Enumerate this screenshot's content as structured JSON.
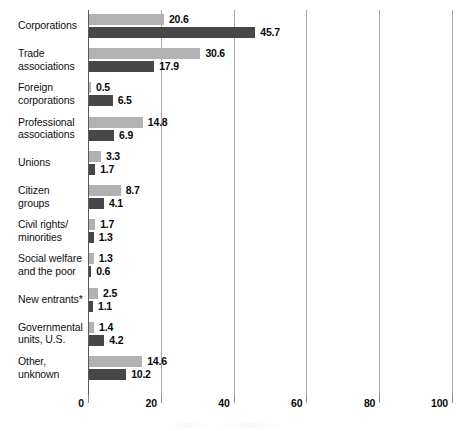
{
  "chart_data": {
    "type": "bar",
    "orientation": "horizontal",
    "title": "",
    "subtitle": "",
    "xlabel": "",
    "ylabel": "",
    "xlim": [
      0,
      100
    ],
    "xticks": [
      0,
      20,
      40,
      60,
      80,
      100
    ],
    "xtick_labels": [
      "0",
      "20",
      "40",
      "60",
      "80",
      "100"
    ],
    "grid": "vertical",
    "legend": "none",
    "footnote_marker": "*",
    "categories": [
      "Corporations",
      "Trade\nassociations",
      "Foreign\ncorporations",
      "Professional\nassociations",
      "Unions",
      "Citizen\ngroups",
      "Civil rights/\nminorities",
      "Social welfare\nand the poor",
      "New entrants*",
      "Governmental\nunits, U.S.",
      "Other,\nunknown"
    ],
    "series": [
      {
        "name": "series-light",
        "color": "#b2b2b2",
        "values": [
          20.6,
          30.6,
          0.5,
          14.8,
          3.3,
          8.7,
          1.7,
          1.3,
          2.5,
          1.4,
          14.6
        ],
        "value_labels": [
          "20.6",
          "30.6",
          "0.5",
          "14.8",
          "3.3",
          "8.7",
          "1.7",
          "1.3",
          "2.5",
          "1.4",
          "14.6"
        ]
      },
      {
        "name": "series-dark",
        "color": "#474747",
        "values": [
          45.7,
          17.9,
          6.5,
          6.9,
          1.7,
          4.1,
          1.3,
          0.6,
          1.1,
          4.2,
          10.2
        ],
        "value_labels": [
          "45.7",
          "17.9",
          "6.5",
          "6.9",
          "1.7",
          "4.1",
          "1.3",
          "0.6",
          "1.1",
          "4.2",
          "10.2"
        ]
      }
    ]
  },
  "colors": {
    "light_bar": "#b2b2b2",
    "dark_bar": "#474747",
    "gridline": "#a9a9a9",
    "axis": "#5a5a5a",
    "text": "#101010",
    "background": "#ffffff"
  }
}
